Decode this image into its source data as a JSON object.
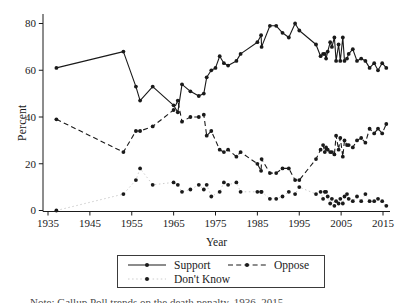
{
  "figure": {
    "background": "#ffffff",
    "line_color": "#1a1a1a",
    "dk_connector_color": "#c6c6c6",
    "caption_partial": "Note: Gallup Poll trends on the death penalty, 1936–2015."
  },
  "chart_data": {
    "type": "line",
    "title": "",
    "xlabel": "Year",
    "ylabel": "Percent",
    "xlim": [
      1933,
      2017.5
    ],
    "ylim": [
      0,
      80
    ],
    "x_ticks": [
      1935,
      1945,
      1955,
      1965,
      1975,
      1985,
      1995,
      2005,
      2015
    ],
    "y_ticks": [
      0,
      20,
      40,
      60,
      80
    ],
    "grid": false,
    "legend": {
      "position": "bottom",
      "border": true,
      "entries": [
        "Support",
        "Oppose",
        "Don't Know"
      ]
    },
    "series": [
      {
        "name": "Support",
        "line_style": "solid",
        "marker": "circle",
        "points": [
          [
            1937,
            61
          ],
          [
            1953,
            68
          ],
          [
            1956,
            53
          ],
          [
            1957,
            47
          ],
          [
            1960,
            53
          ],
          [
            1965,
            45
          ],
          [
            1966,
            42
          ],
          [
            1967,
            54
          ],
          [
            1969,
            51
          ],
          [
            1971,
            49
          ],
          [
            1972.2,
            50
          ],
          [
            1972.9,
            57
          ],
          [
            1974,
            60
          ],
          [
            1975,
            61
          ],
          [
            1976,
            66
          ],
          [
            1977,
            63
          ],
          [
            1978,
            62
          ],
          [
            1980,
            64
          ],
          [
            1981,
            67
          ],
          [
            1985,
            72
          ],
          [
            1985.9,
            75
          ],
          [
            1986,
            70
          ],
          [
            1988,
            79
          ],
          [
            1989.5,
            79
          ],
          [
            1991,
            76
          ],
          [
            1992.5,
            74
          ],
          [
            1994,
            80
          ],
          [
            1995,
            77
          ],
          [
            1999,
            71
          ],
          [
            2000.1,
            66
          ],
          [
            2000.7,
            67
          ],
          [
            2001.1,
            67
          ],
          [
            2001.4,
            65
          ],
          [
            2001.8,
            68
          ],
          [
            2002.4,
            72
          ],
          [
            2002.8,
            70
          ],
          [
            2003.4,
            74
          ],
          [
            2003.8,
            64
          ],
          [
            2004.4,
            71
          ],
          [
            2004.8,
            64
          ],
          [
            2005.4,
            74
          ],
          [
            2005.8,
            64
          ],
          [
            2006.4,
            65
          ],
          [
            2006.8,
            67
          ],
          [
            2007.8,
            69
          ],
          [
            2008.8,
            64
          ],
          [
            2009.8,
            65
          ],
          [
            2010.8,
            64
          ],
          [
            2011.8,
            61
          ],
          [
            2012.9,
            63
          ],
          [
            2013.8,
            60
          ],
          [
            2014.8,
            63
          ],
          [
            2015.8,
            61
          ]
        ]
      },
      {
        "name": "Oppose",
        "line_style": "dashed",
        "marker": "circle",
        "points": [
          [
            1937,
            39
          ],
          [
            1953,
            25
          ],
          [
            1956,
            34
          ],
          [
            1957,
            34
          ],
          [
            1960,
            36
          ],
          [
            1965,
            43
          ],
          [
            1966,
            47
          ],
          [
            1967,
            38
          ],
          [
            1969,
            40
          ],
          [
            1971,
            40
          ],
          [
            1972.2,
            41
          ],
          [
            1972.9,
            32
          ],
          [
            1974,
            34
          ],
          [
            1976,
            26
          ],
          [
            1977,
            25
          ],
          [
            1978,
            26
          ],
          [
            1980,
            23
          ],
          [
            1981,
            25
          ],
          [
            1985,
            20
          ],
          [
            1985.9,
            17
          ],
          [
            1986,
            22
          ],
          [
            1988,
            16
          ],
          [
            1989.5,
            16
          ],
          [
            1991,
            18
          ],
          [
            1992.5,
            18
          ],
          [
            1994,
            13
          ],
          [
            1995,
            13
          ],
          [
            1999,
            22
          ],
          [
            2000.1,
            26
          ],
          [
            2000.7,
            28
          ],
          [
            2001.1,
            25
          ],
          [
            2001.4,
            27
          ],
          [
            2001.8,
            26
          ],
          [
            2002.4,
            25
          ],
          [
            2002.8,
            25
          ],
          [
            2003.4,
            24
          ],
          [
            2003.8,
            32
          ],
          [
            2004.4,
            26
          ],
          [
            2004.8,
            31
          ],
          [
            2005.4,
            23
          ],
          [
            2005.8,
            30
          ],
          [
            2006.4,
            28
          ],
          [
            2006.8,
            28
          ],
          [
            2007.8,
            27
          ],
          [
            2008.8,
            30
          ],
          [
            2009.8,
            31
          ],
          [
            2010.8,
            29
          ],
          [
            2011.8,
            35
          ],
          [
            2012.9,
            33
          ],
          [
            2013.8,
            35
          ],
          [
            2014.8,
            33
          ],
          [
            2015.8,
            37
          ]
        ]
      },
      {
        "name": "Don't Know",
        "line_style": "dotted-faint",
        "marker": "circle",
        "points": [
          [
            1937,
            0
          ],
          [
            1953,
            7
          ],
          [
            1956,
            13
          ],
          [
            1957,
            18
          ],
          [
            1960,
            11
          ],
          [
            1965,
            12
          ],
          [
            1966,
            11
          ],
          [
            1967,
            8
          ],
          [
            1969,
            9
          ],
          [
            1971,
            11
          ],
          [
            1972.2,
            9
          ],
          [
            1972.9,
            11
          ],
          [
            1974,
            6
          ],
          [
            1976,
            8
          ],
          [
            1977,
            12
          ],
          [
            1978,
            11
          ],
          [
            1980,
            12
          ],
          [
            1981,
            8
          ],
          [
            1985,
            8
          ],
          [
            1985.9,
            8
          ],
          [
            1986,
            8
          ],
          [
            1988,
            5
          ],
          [
            1989.5,
            5
          ],
          [
            1991,
            6
          ],
          [
            1992.5,
            8
          ],
          [
            1994,
            7
          ],
          [
            1995,
            10
          ],
          [
            1999,
            7
          ],
          [
            2000.1,
            8
          ],
          [
            2000.7,
            5
          ],
          [
            2001.1,
            8
          ],
          [
            2001.4,
            8
          ],
          [
            2001.8,
            6
          ],
          [
            2002.4,
            3
          ],
          [
            2002.8,
            5
          ],
          [
            2003.4,
            2
          ],
          [
            2003.8,
            4
          ],
          [
            2004.4,
            3
          ],
          [
            2004.8,
            5
          ],
          [
            2005.4,
            3
          ],
          [
            2005.8,
            6
          ],
          [
            2006.4,
            7
          ],
          [
            2006.8,
            5
          ],
          [
            2007.8,
            4
          ],
          [
            2008.8,
            6
          ],
          [
            2009.8,
            4
          ],
          [
            2010.8,
            7
          ],
          [
            2011.8,
            4
          ],
          [
            2012.9,
            4
          ],
          [
            2013.8,
            5
          ],
          [
            2014.8,
            4
          ],
          [
            2015.8,
            2
          ]
        ]
      }
    ]
  }
}
